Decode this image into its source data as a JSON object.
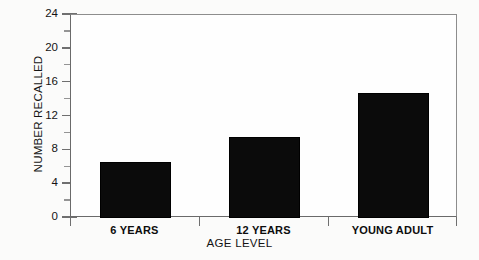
{
  "chart_data": {
    "type": "bar",
    "title": "",
    "categories": [
      "6 YEARS",
      "12 YEARS",
      "YOUNG ADULT"
    ],
    "values": [
      6.6,
      9.6,
      14.8
    ],
    "xlabel": "AGE LEVEL",
    "ylabel": "NUMBER RECALLED",
    "ylim": [
      0,
      24
    ],
    "yticks": [
      0,
      4,
      8,
      12,
      16,
      20,
      24
    ],
    "ytick_labels": [
      "0",
      "4",
      "8",
      "12",
      "16",
      "20",
      "24"
    ],
    "minor_tick_interval": 2,
    "grid": false,
    "legend": false,
    "bar_color": "#0b0b0b",
    "frame_color": "#8d8d8d",
    "background": "#fbfbfa"
  }
}
